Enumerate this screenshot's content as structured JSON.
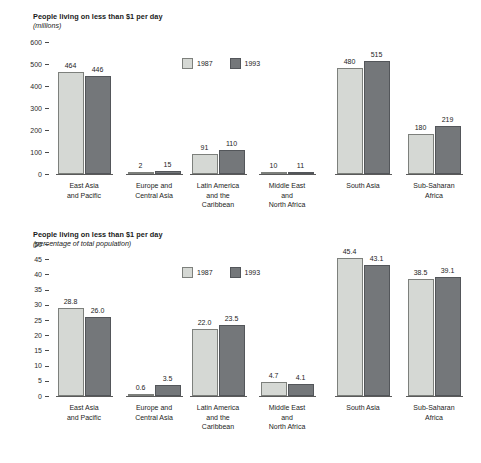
{
  "chart_data": [
    {
      "id": "millions",
      "type": "bar",
      "title": "People living on less than $1 per day",
      "subtitle": "(millions)",
      "xlabel": "",
      "ylabel": "",
      "ylim": [
        0,
        600
      ],
      "yticks": [
        600,
        500,
        400,
        300,
        200,
        100,
        0
      ],
      "grid": false,
      "legend_position": "top-center",
      "categories": [
        "East Asia\nand Pacific",
        "Europe and\nCentral Asia",
        "Latin America\nand the\nCaribbean",
        "Middle East\nand\nNorth Africa",
        "South Asia",
        "Sub-Saharan\nAfrica"
      ],
      "series": [
        {
          "name": "1987",
          "color": "#d5d8d4",
          "values": [
            464,
            2,
            91,
            10,
            480,
            180
          ]
        },
        {
          "name": "1993",
          "color": "#74777a",
          "values": [
            446,
            15,
            110,
            11,
            515,
            219
          ]
        }
      ]
    },
    {
      "id": "percent",
      "type": "bar",
      "title": "People living on less than $1 per day",
      "subtitle": "(percentage of total population)",
      "xlabel": "",
      "ylabel": "",
      "ylim": [
        0,
        50
      ],
      "yticks": [
        50,
        45,
        40,
        35,
        30,
        25,
        20,
        15,
        10,
        5,
        0
      ],
      "grid": false,
      "legend_position": "top-center",
      "categories": [
        "East Asia\nand Pacific",
        "Europe and\nCentral Asia",
        "Latin America\nand the\nCaribbean",
        "Middle East\nand\nNorth Africa",
        "South Asia",
        "Sub-Saharan\nAfrica"
      ],
      "series": [
        {
          "name": "1987",
          "color": "#d5d8d4",
          "values": [
            28.8,
            0.6,
            22.0,
            4.7,
            45.4,
            38.5
          ]
        },
        {
          "name": "1993",
          "color": "#74777a",
          "values": [
            26.0,
            3.5,
            23.5,
            4.1,
            43.1,
            39.1
          ]
        }
      ],
      "value_labels": [
        [
          "28.8",
          "0.6",
          "22.0",
          "4.7",
          "45.4",
          "38.5"
        ],
        [
          "26.0",
          "3.5",
          "23.5",
          "4.1",
          "43.1",
          "39.1"
        ]
      ]
    }
  ]
}
